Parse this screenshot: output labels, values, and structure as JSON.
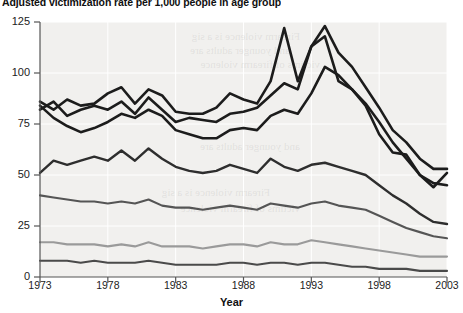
{
  "title": "Adjusted victimization rate per 1,000 people in age group",
  "axes": {
    "x_label": "Year",
    "y_label": "",
    "x_ticks": [
      "1973",
      "1978",
      "1983",
      "1988",
      "1993",
      "1998",
      "2003"
    ],
    "y_ticks": [
      "0",
      "25",
      "50",
      "75",
      "100",
      "125"
    ]
  },
  "colors": {
    "series_1": "#1c1c1c",
    "series_2": "#1c1c1c",
    "series_3": "#1c1c1c",
    "series_4": "#2e2e2e",
    "series_5": "#555555",
    "series_6": "#9a9a9a",
    "series_7": "#4a4a4a",
    "plot_background": "#f1f0ee",
    "gridline": "#ffffff",
    "axis": "#555555"
  },
  "chart_data": {
    "type": "line",
    "title": "Adjusted victimization rate per 1,000 people in age group",
    "xlabel": "Year",
    "ylabel": "",
    "xlim": [
      1973,
      2003
    ],
    "ylim": [
      0,
      125
    ],
    "grid": true,
    "legend": "none",
    "x": [
      1973,
      1974,
      1975,
      1976,
      1977,
      1978,
      1979,
      1980,
      1981,
      1982,
      1983,
      1984,
      1985,
      1986,
      1987,
      1988,
      1989,
      1990,
      1991,
      1992,
      1993,
      1994,
      1995,
      1996,
      1997,
      1998,
      1999,
      2000,
      2001,
      2002,
      2003
    ],
    "series": [
      {
        "name": "age-12-15",
        "color": "#1c1c1c",
        "values": [
          86,
          82,
          87,
          84,
          85,
          90,
          93,
          85,
          92,
          89,
          81,
          80,
          80,
          83,
          90,
          87,
          85,
          96,
          122,
          96,
          113,
          118,
          96,
          92,
          84,
          70,
          61,
          60,
          50,
          44,
          51
        ]
      },
      {
        "name": "age-16-19",
        "color": "#1c1c1c",
        "values": [
          82,
          86,
          79,
          82,
          84,
          82,
          86,
          80,
          88,
          82,
          76,
          78,
          77,
          76,
          80,
          81,
          83,
          89,
          95,
          92,
          113,
          123,
          110,
          103,
          93,
          83,
          72,
          66,
          58,
          53,
          53
        ]
      },
      {
        "name": "age-20-24",
        "color": "#1c1c1c",
        "values": [
          84,
          78,
          74,
          71,
          73,
          76,
          80,
          78,
          82,
          79,
          72,
          70,
          68,
          68,
          72,
          73,
          72,
          79,
          82,
          80,
          90,
          103,
          99,
          92,
          85,
          76,
          66,
          58,
          50,
          46,
          45
        ]
      },
      {
        "name": "age-25-34",
        "color": "#2e2e2e",
        "values": [
          51,
          57,
          55,
          57,
          59,
          57,
          62,
          57,
          63,
          58,
          54,
          52,
          51,
          52,
          55,
          53,
          51,
          58,
          54,
          52,
          55,
          56,
          54,
          52,
          50,
          45,
          40,
          36,
          31,
          27,
          26
        ]
      },
      {
        "name": "age-35-49",
        "color": "#555555",
        "values": [
          40,
          39,
          38,
          37,
          37,
          36,
          37,
          36,
          38,
          35,
          34,
          34,
          33,
          34,
          35,
          34,
          33,
          36,
          35,
          34,
          36,
          37,
          35,
          34,
          33,
          30,
          27,
          24,
          22,
          20,
          19
        ]
      },
      {
        "name": "age-50-64",
        "color": "#9a9a9a",
        "values": [
          17,
          17,
          16,
          16,
          16,
          15,
          16,
          15,
          17,
          15,
          15,
          15,
          14,
          15,
          16,
          16,
          15,
          17,
          16,
          16,
          18,
          17,
          16,
          15,
          14,
          13,
          12,
          11,
          10,
          10,
          10
        ]
      },
      {
        "name": "age-65-plus",
        "color": "#4a4a4a",
        "values": [
          8,
          8,
          8,
          7,
          8,
          7,
          7,
          7,
          8,
          7,
          6,
          6,
          6,
          6,
          7,
          7,
          6,
          7,
          7,
          6,
          7,
          7,
          6,
          5,
          5,
          4,
          4,
          4,
          3,
          3,
          3
        ]
      }
    ]
  },
  "bleed_through": {
    "line1": "Firearm violence is a sig",
    "line2": "and younger adults are",
    "line3": "victims of firearm violence"
  }
}
